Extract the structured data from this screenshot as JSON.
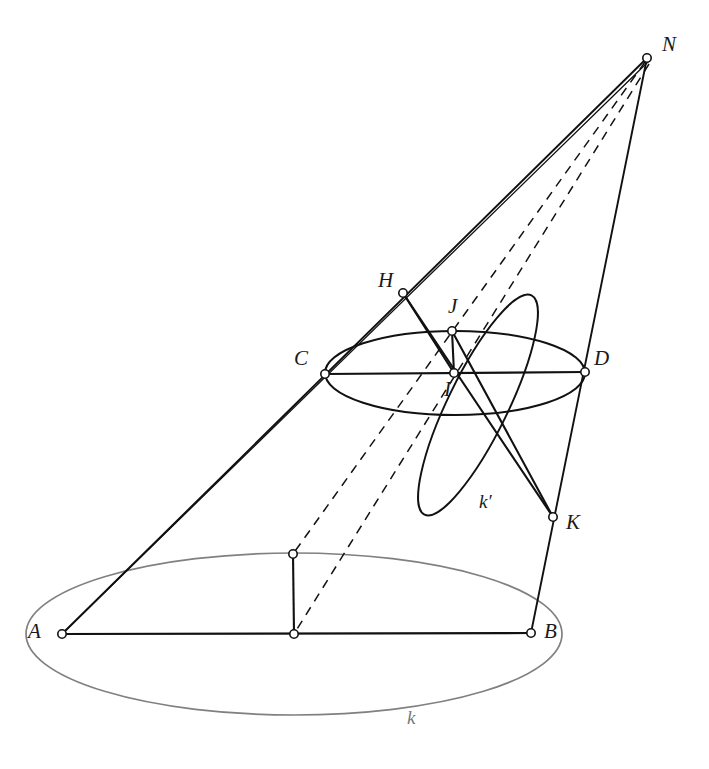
{
  "figure": {
    "background": "#ffffff",
    "stroke_main": "#111111",
    "stroke_base": "#808080",
    "vertex_fill": "#ffffff"
  },
  "labels": {
    "N": "N",
    "H": "H",
    "J": "J",
    "I": "I",
    "C": "C",
    "D": "D",
    "K": "K",
    "A": "A",
    "B": "B",
    "k": "k",
    "kprime": "k′"
  },
  "label_positions": {
    "N": {
      "x": 662,
      "y": 34
    },
    "H": {
      "x": 378,
      "y": 270
    },
    "J": {
      "x": 448,
      "y": 296
    },
    "I": {
      "x": 444,
      "y": 379
    },
    "C": {
      "x": 294,
      "y": 348
    },
    "D": {
      "x": 594,
      "y": 348
    },
    "K": {
      "x": 566,
      "y": 512
    },
    "A": {
      "x": 28,
      "y": 621
    },
    "B": {
      "x": 544,
      "y": 621
    },
    "k": {
      "x": 407,
      "y": 708
    },
    "kprime": {
      "x": 479,
      "y": 492
    }
  },
  "points": {
    "N": {
      "x": 647,
      "y": 58
    },
    "A": {
      "x": 62,
      "y": 634
    },
    "B": {
      "x": 531,
      "y": 633
    },
    "C": {
      "x": 325,
      "y": 374
    },
    "D": {
      "x": 585,
      "y": 372
    },
    "H": {
      "x": 403,
      "y": 293
    },
    "J": {
      "x": 452,
      "y": 331
    },
    "I": {
      "x": 454,
      "y": 373
    },
    "K": {
      "x": 553,
      "y": 517
    },
    "M_top": {
      "x": 293,
      "y": 554
    },
    "M_center": {
      "x": 294,
      "y": 634
    }
  },
  "ellipses": {
    "base_k": {
      "cx": 294,
      "cy": 634,
      "rx": 268,
      "ry": 81,
      "rotation": 0,
      "color": "#808080",
      "width": 1.6
    },
    "cut_CD": {
      "cx": 455,
      "cy": 373,
      "rx": 130,
      "ry": 42,
      "rotation": 0,
      "color": "#111111",
      "width": 2.0
    },
    "sphere_kprime": {
      "cx": 478,
      "cy": 405,
      "rx": 122,
      "ry": 30,
      "rotation": -64,
      "color": "#111111",
      "width": 1.8
    }
  },
  "segments": [
    {
      "name": "edge-A-N",
      "from": "A",
      "to": "N",
      "style": "solid",
      "color": "#111111"
    },
    {
      "name": "edge-A-C-N-outer",
      "from": "A",
      "to": "N",
      "style": "solid",
      "color": "#111111"
    },
    {
      "name": "edge-B-N",
      "from": "B",
      "to": "N",
      "style": "solid",
      "color": "#111111"
    },
    {
      "name": "chord-A-B",
      "from": "A",
      "to": "B",
      "style": "solid",
      "color": "#111111"
    },
    {
      "name": "chord-C-D",
      "from": "C",
      "to": "D",
      "style": "solid",
      "color": "#111111"
    },
    {
      "name": "radius-M",
      "from": "M_top",
      "to": "M_center",
      "style": "solid",
      "color": "#111111"
    },
    {
      "name": "segment-J-I",
      "from": "J",
      "to": "I",
      "style": "solid",
      "color": "#111111"
    },
    {
      "name": "segment-H-I",
      "from": "H",
      "to": "I",
      "style": "solid",
      "color": "#111111"
    },
    {
      "name": "segment-H-K",
      "from": "H",
      "to": "K",
      "style": "solid",
      "color": "#111111"
    },
    {
      "name": "segment-J-K",
      "from": "J",
      "to": "K",
      "style": "solid",
      "color": "#111111"
    },
    {
      "name": "ray-N-J-dashed",
      "from": "N",
      "to": "M_top",
      "style": "dashed",
      "color": "#111111"
    },
    {
      "name": "ray-N-I-dashed",
      "from": "N",
      "to": "M_center",
      "style": "dashed",
      "color": "#111111"
    }
  ],
  "vertices": [
    "N",
    "H",
    "J",
    "I",
    "C",
    "D",
    "K",
    "A",
    "B",
    "M_top",
    "M_center"
  ]
}
